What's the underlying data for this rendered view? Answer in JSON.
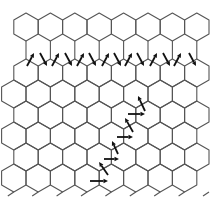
{
  "diagram": {
    "type": "hexagonal-lattice-with-spin-arrows",
    "width": 221,
    "height": 205,
    "line_color": "#555555",
    "arrow_color": "#111111",
    "hex_radius": 14,
    "hex_dx": 24.4,
    "top_row": {
      "center_y": 27,
      "start_x": 26,
      "count": 8
    },
    "lower_rows": [
      {
        "center_y": 73,
        "start_x": 26,
        "count": 8
      },
      {
        "center_y": 94,
        "start_x": 13.8,
        "count": 9
      },
      {
        "center_y": 115,
        "start_x": 26,
        "count": 8
      },
      {
        "center_y": 136,
        "start_x": 13.8,
        "count": 9
      },
      {
        "center_y": 157,
        "start_x": 26,
        "count": 8
      },
      {
        "center_y": 178,
        "start_x": 13.8,
        "count": 9
      }
    ],
    "gap_stubs": {
      "from_y": 41,
      "to_y": 59,
      "x_start": 26,
      "count": 8
    },
    "bottom_stubs": {
      "y": 192,
      "x_start": 13.8,
      "count": 9
    },
    "zigzag_arrows": [
      {
        "x1": 27,
        "y1": 66,
        "x2": 34,
        "y2": 53
      },
      {
        "x1": 40,
        "y1": 53,
        "x2": 47,
        "y2": 66
      },
      {
        "x1": 52,
        "y1": 66,
        "x2": 59,
        "y2": 53
      },
      {
        "x1": 65,
        "y1": 53,
        "x2": 72,
        "y2": 66
      },
      {
        "x1": 77,
        "y1": 66,
        "x2": 84,
        "y2": 53
      },
      {
        "x1": 89,
        "y1": 53,
        "x2": 96,
        "y2": 66
      },
      {
        "x1": 102,
        "y1": 66,
        "x2": 109,
        "y2": 53
      },
      {
        "x1": 114,
        "y1": 53,
        "x2": 121,
        "y2": 66
      },
      {
        "x1": 125,
        "y1": 66,
        "x2": 132,
        "y2": 53
      },
      {
        "x1": 137,
        "y1": 53,
        "x2": 144,
        "y2": 66
      },
      {
        "x1": 150,
        "y1": 66,
        "x2": 157,
        "y2": 53
      },
      {
        "x1": 163,
        "y1": 53,
        "x2": 170,
        "y2": 66
      },
      {
        "x1": 174,
        "y1": 66,
        "x2": 181,
        "y2": 53
      },
      {
        "x1": 189,
        "y1": 53,
        "x2": 196,
        "y2": 66
      }
    ],
    "diagonal_arrows": [
      {
        "x1": 90,
        "y1": 181,
        "x2": 108,
        "y2": 181
      },
      {
        "x1": 108,
        "y1": 175,
        "x2": 99,
        "y2": 162
      },
      {
        "x1": 104,
        "y1": 159,
        "x2": 119,
        "y2": 159
      },
      {
        "x1": 118,
        "y1": 154,
        "x2": 112,
        "y2": 141
      },
      {
        "x1": 117,
        "y1": 137,
        "x2": 133,
        "y2": 137
      },
      {
        "x1": 133,
        "y1": 132,
        "x2": 125,
        "y2": 118
      },
      {
        "x1": 128,
        "y1": 114,
        "x2": 145,
        "y2": 114
      },
      {
        "x1": 145,
        "y1": 111,
        "x2": 138,
        "y2": 96
      }
    ]
  }
}
